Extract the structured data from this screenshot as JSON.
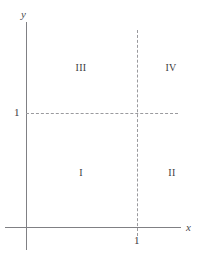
{
  "chart_data": {
    "type": "diagram",
    "title": "",
    "xlabel": "x",
    "ylabel": "y",
    "xlim": [
      0,
      1.35
    ],
    "ylim": [
      0,
      1.6
    ],
    "grid": false,
    "axes": {
      "x_axis_label": "x",
      "y_axis_label": "y",
      "x_ticks": [
        "1"
      ],
      "y_ticks": [
        "1"
      ],
      "x_tick_values": [
        1
      ],
      "y_tick_values": [
        1
      ]
    },
    "reference_lines": [
      {
        "name": "horizontal-gridline-y-equals-1",
        "orientation": "horizontal",
        "value": 1,
        "style": "dashed"
      },
      {
        "name": "vertical-gridline-x-equals-1",
        "orientation": "vertical",
        "value": 1,
        "style": "dashed"
      }
    ],
    "regions": [
      {
        "label": "I",
        "position": "lower-left",
        "x_range": [
          0,
          1
        ],
        "y_range": [
          0,
          1
        ]
      },
      {
        "label": "II",
        "position": "lower-right",
        "x_range": [
          1,
          1.35
        ],
        "y_range": [
          0,
          1
        ]
      },
      {
        "label": "III",
        "position": "upper-left",
        "x_range": [
          0,
          1
        ],
        "y_range": [
          1,
          1.6
        ]
      },
      {
        "label": "IV",
        "position": "upper-right",
        "x_range": [
          1,
          1.35
        ],
        "y_range": [
          1,
          1.6
        ]
      }
    ],
    "colors": {
      "axis": "#808084",
      "dashed_line": "#9a9a9e",
      "text": "#3c3c40",
      "background": "#ffffff"
    }
  },
  "figure": {
    "axes": {
      "y_label": "y",
      "x_label": "x"
    },
    "ticks": {
      "y_one": "1",
      "x_one": "1"
    },
    "quadrants": {
      "upper_left": "III",
      "upper_right": "IV",
      "lower_left": "I",
      "lower_right": "II"
    }
  }
}
